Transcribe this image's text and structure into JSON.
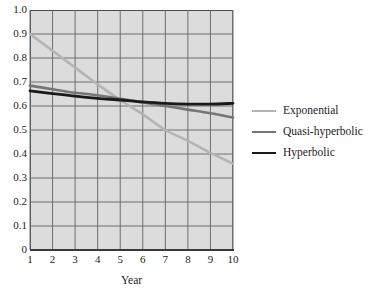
{
  "chart_data": {
    "type": "line",
    "title": "",
    "xlabel": "Year",
    "ylabel": "",
    "xlim": [
      1,
      10
    ],
    "ylim": [
      0,
      1.0
    ],
    "grid": true,
    "legend_position": "right",
    "x": [
      1,
      2,
      3,
      4,
      5,
      6,
      7,
      8,
      9,
      10
    ],
    "xtick_labels": [
      "1",
      "2",
      "3",
      "4",
      "5",
      "6",
      "7",
      "8",
      "9",
      "10"
    ],
    "ytick_labels": [
      "1.0",
      "0.9",
      "0.8",
      "0.7",
      "0.6",
      "0.5",
      "0.4",
      "0.3",
      "0.2",
      "0.1",
      "0"
    ],
    "ytick_values": [
      1.0,
      0.9,
      0.8,
      0.7,
      0.6,
      0.5,
      0.4,
      0.3,
      0.2,
      0.1,
      0
    ],
    "series": [
      {
        "name": "Exponential",
        "color": "#b4b4b4",
        "width": 2.6,
        "values": [
          0.9,
          0.83,
          0.76,
          0.69,
          0.625,
          0.565,
          0.5,
          0.455,
          0.405,
          0.36
        ]
      },
      {
        "name": "Quasi-hyperbolic",
        "color": "#757575",
        "width": 2.6,
        "values": [
          0.685,
          0.67,
          0.655,
          0.645,
          0.63,
          0.615,
          0.6,
          0.585,
          0.57,
          0.552
        ]
      },
      {
        "name": "Hyperbolic",
        "color": "#1a1a1a",
        "width": 2.8,
        "values": [
          0.663,
          0.652,
          0.641,
          0.632,
          0.625,
          0.617,
          0.611,
          0.608,
          0.608,
          0.611
        ]
      }
    ]
  },
  "axis": {
    "x_title": "Year"
  },
  "legend": {
    "items": [
      {
        "label": "Exponential"
      },
      {
        "label": "Quasi-hyperbolic"
      },
      {
        "label": "Hyperbolic"
      }
    ]
  }
}
